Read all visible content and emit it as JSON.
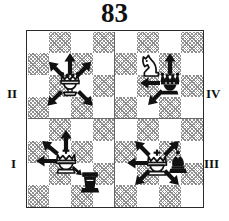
{
  "figure": {
    "title": "83",
    "type": "chess-diagram"
  },
  "board": {
    "files": 8,
    "ranks": 8,
    "square_size_px": 21.875,
    "light_color": "#ffffff",
    "dark_color": "#8a8a8a",
    "dark_fill_style": "diagonal-hatch",
    "border_color": "#2b2b2b",
    "divider_color": "#666666",
    "divider": "cross-split-into-four-quadrants"
  },
  "quadrants": [
    {
      "id": "I",
      "label": "I",
      "position": "bottom-left"
    },
    {
      "id": "II",
      "label": "II",
      "position": "top-left"
    },
    {
      "id": "III",
      "label": "III",
      "position": "bottom-right"
    },
    {
      "id": "IV",
      "label": "IV",
      "position": "top-right"
    }
  ],
  "pieces": [
    {
      "quadrant": "II",
      "piece": "queen",
      "color": "white",
      "name": "white-queen"
    },
    {
      "quadrant": "IV",
      "piece": "queen",
      "color": "black",
      "name": "black-queen"
    },
    {
      "quadrant": "IV",
      "piece": "knight",
      "color": "white",
      "name": "white-knight"
    },
    {
      "quadrant": "I",
      "piece": "king",
      "color": "white",
      "name": "white-king"
    },
    {
      "quadrant": "I",
      "piece": "rook",
      "color": "black",
      "name": "black-rook"
    },
    {
      "quadrant": "III",
      "piece": "king",
      "color": "white",
      "name": "white-king"
    },
    {
      "quadrant": "III",
      "piece": "bishop",
      "color": "black",
      "name": "black-bishop"
    }
  ],
  "arrows": [
    {
      "quadrant": "II",
      "from": "white-queen",
      "directions": [
        "up",
        "up-left",
        "up-right",
        "down-left",
        "down-right"
      ],
      "count": 5
    },
    {
      "quadrant": "IV",
      "from": "black-queen",
      "directions": [
        "up",
        "left",
        "down-left"
      ],
      "count": 3
    },
    {
      "quadrant": "I",
      "from": "white-king",
      "directions": [
        "up",
        "up-left",
        "left",
        "down-right"
      ],
      "count": 4
    },
    {
      "quadrant": "III",
      "from": "white-king",
      "directions": [
        "up-left",
        "up-right",
        "left",
        "down-left",
        "down-right"
      ],
      "count": 5
    }
  ]
}
